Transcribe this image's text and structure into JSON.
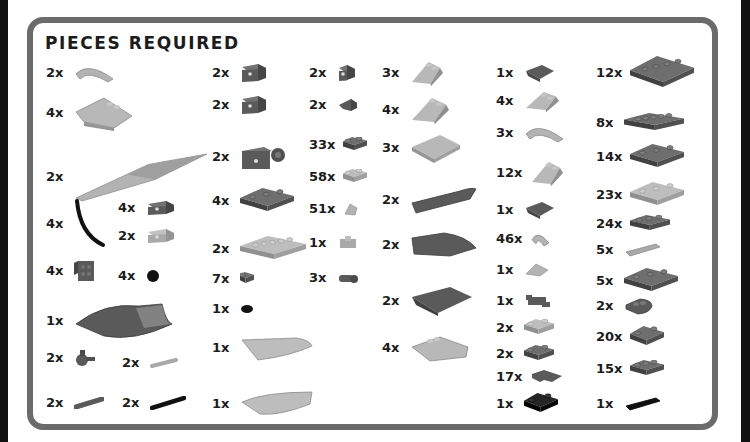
{
  "title": "PIECES REQUIRED",
  "colors": {
    "frame_border": "#6b6b6b",
    "background": "#ffffff",
    "dark_gray": "#5a5a5a",
    "light_gray": "#a9a9a9",
    "black": "#111111"
  },
  "pieces": [
    {
      "qty": "2x",
      "icon": "curved-slope-1x4",
      "color": "light_gray",
      "x": 46,
      "y": 73
    },
    {
      "qty": "4x",
      "icon": "wedge-slope-4x4",
      "color": "light_gray",
      "x": 46,
      "y": 113
    },
    {
      "qty": "2x",
      "icon": "wedge-wing-12",
      "color": "light_gray",
      "x": 46,
      "y": 177
    },
    {
      "qty": "4x",
      "icon": "flexible-tube-curved",
      "color": "black",
      "x": 46,
      "y": 224
    },
    {
      "qty": "4x",
      "icon": "bracket-1x2-inverted",
      "color": "dark_gray",
      "x": 118,
      "y": 208
    },
    {
      "qty": "2x",
      "icon": "bracket-1x2",
      "color": "light_gray",
      "x": 118,
      "y": 236
    },
    {
      "qty": "4x",
      "icon": "bracket-2x2-vertical",
      "color": "dark_gray",
      "x": 46,
      "y": 271
    },
    {
      "qty": "4x",
      "icon": "round-tile-1x1",
      "color": "black",
      "x": 118,
      "y": 276
    },
    {
      "qty": "1x",
      "icon": "wedge-plate-curved-large",
      "color": "dark_gray",
      "x": 46,
      "y": 321
    },
    {
      "qty": "2x",
      "icon": "technic-pin-connector",
      "color": "dark_gray",
      "x": 46,
      "y": 358
    },
    {
      "qty": "2x",
      "icon": "bar-1x3",
      "color": "light_gray",
      "x": 122,
      "y": 363
    },
    {
      "qty": "2x",
      "icon": "technic-pin-axle",
      "color": "dark_gray",
      "x": 46,
      "y": 403
    },
    {
      "qty": "2x",
      "icon": "technic-axle-long",
      "color": "black",
      "x": 122,
      "y": 403
    },
    {
      "qty": "2x",
      "icon": "technic-brick-1x2-hole",
      "color": "dark_gray",
      "x": 212,
      "y": 73
    },
    {
      "qty": "2x",
      "icon": "technic-brick-1x2-hole",
      "color": "dark_gray",
      "x": 212,
      "y": 105
    },
    {
      "qty": "2x",
      "icon": "brick-with-wheel-holder",
      "color": "dark_gray",
      "x": 212,
      "y": 157
    },
    {
      "qty": "4x",
      "icon": "plate-2x4",
      "color": "dark_gray",
      "x": 212,
      "y": 201
    },
    {
      "qty": "2x",
      "icon": "plate-2x6",
      "color": "light_gray",
      "x": 212,
      "y": 249
    },
    {
      "qty": "7x",
      "icon": "plate-1x1",
      "color": "dark_gray",
      "x": 212,
      "y": 279
    },
    {
      "qty": "1x",
      "icon": "round-plate-1x1",
      "color": "black",
      "x": 212,
      "y": 309
    },
    {
      "qty": "1x",
      "icon": "curved-wedge-light",
      "color": "light_gray",
      "x": 212,
      "y": 348
    },
    {
      "qty": "1x",
      "icon": "curved-wedge-light-mirror",
      "color": "light_gray",
      "x": 212,
      "y": 404
    },
    {
      "qty": "2x",
      "icon": "technic-brick-1x1-hole",
      "color": "dark_gray",
      "x": 309,
      "y": 73
    },
    {
      "qty": "2x",
      "icon": "slope-inverted-1x2",
      "color": "dark_gray",
      "x": 309,
      "y": 105
    },
    {
      "qty": "33x",
      "icon": "plate-1x2",
      "color": "dark_gray",
      "x": 309,
      "y": 145
    },
    {
      "qty": "58x",
      "icon": "plate-1x2",
      "color": "light_gray",
      "x": 309,
      "y": 177
    },
    {
      "qty": "51x",
      "icon": "slope-1x1",
      "color": "light_gray",
      "x": 309,
      "y": 209
    },
    {
      "qty": "1x",
      "icon": "plate-modified-clips",
      "color": "light_gray",
      "x": 309,
      "y": 243
    },
    {
      "qty": "3x",
      "icon": "plate-rounded-pin",
      "color": "dark_gray",
      "x": 309,
      "y": 278
    },
    {
      "qty": "3x",
      "icon": "slope-2x2-45",
      "color": "light_gray",
      "x": 382,
      "y": 73
    },
    {
      "qty": "4x",
      "icon": "wedge-slope-2x3",
      "color": "light_gray",
      "x": 382,
      "y": 110
    },
    {
      "qty": "3x",
      "icon": "slope-3x4",
      "color": "light_gray",
      "x": 382,
      "y": 148
    },
    {
      "qty": "2x",
      "icon": "curved-slope-2x6",
      "color": "dark_gray",
      "x": 382,
      "y": 200
    },
    {
      "qty": "2x",
      "icon": "curved-wedge-2x4",
      "color": "dark_gray",
      "x": 382,
      "y": 245
    },
    {
      "qty": "2x",
      "icon": "slope-inverted-double",
      "color": "dark_gray",
      "x": 382,
      "y": 301
    },
    {
      "qty": "4x",
      "icon": "wedge-slope-3x4-studs",
      "color": "light_gray",
      "x": 382,
      "y": 348
    },
    {
      "qty": "1x",
      "icon": "slope-inverted-2x2",
      "color": "dark_gray",
      "x": 496,
      "y": 73
    },
    {
      "qty": "4x",
      "icon": "wedge-slope-2x2-split",
      "color": "light_gray",
      "x": 496,
      "y": 101
    },
    {
      "qty": "3x",
      "icon": "curved-slope-1x4-arch",
      "color": "light_gray",
      "x": 496,
      "y": 133
    },
    {
      "qty": "12x",
      "icon": "slope-2x2",
      "color": "light_gray",
      "x": 496,
      "y": 173
    },
    {
      "qty": "1x",
      "icon": "slope-inverted-2x2",
      "color": "dark_gray",
      "x": 496,
      "y": 210
    },
    {
      "qty": "46x",
      "icon": "curved-slope-1x2",
      "color": "light_gray",
      "x": 496,
      "y": 239
    },
    {
      "qty": "1x",
      "icon": "slope-1x2-cheese",
      "color": "light_gray",
      "x": 496,
      "y": 270
    },
    {
      "qty": "1x",
      "icon": "plate-clip-horizontal",
      "color": "dark_gray",
      "x": 496,
      "y": 301
    },
    {
      "qty": "2x",
      "icon": "plate-1x2-handle",
      "color": "light_gray",
      "x": 496,
      "y": 328
    },
    {
      "qty": "2x",
      "icon": "plate-1x2-bar",
      "color": "dark_gray",
      "x": 496,
      "y": 354
    },
    {
      "qty": "17x",
      "icon": "plate-corner-2x2",
      "color": "dark_gray",
      "x": 496,
      "y": 377
    },
    {
      "qty": "1x",
      "icon": "plate-2x2",
      "color": "black",
      "x": 496,
      "y": 404
    },
    {
      "qty": "12x",
      "icon": "plate-4x4",
      "color": "dark_gray",
      "x": 596,
      "y": 73
    },
    {
      "qty": "8x",
      "icon": "plate-1x6",
      "color": "dark_gray",
      "x": 596,
      "y": 123
    },
    {
      "qty": "14x",
      "icon": "plate-2x4",
      "color": "dark_gray",
      "x": 596,
      "y": 157
    },
    {
      "qty": "23x",
      "icon": "plate-2x3",
      "color": "light_gray",
      "x": 596,
      "y": 195
    },
    {
      "qty": "24x",
      "icon": "plate-1x4",
      "color": "dark_gray",
      "x": 596,
      "y": 224
    },
    {
      "qty": "5x",
      "icon": "tile-1x4",
      "color": "light_gray",
      "x": 596,
      "y": 250
    },
    {
      "qty": "5x",
      "icon": "plate-2x3",
      "color": "dark_gray",
      "x": 596,
      "y": 281
    },
    {
      "qty": "2x",
      "icon": "plate-rounded-2x2",
      "color": "dark_gray",
      "x": 596,
      "y": 306
    },
    {
      "qty": "20x",
      "icon": "plate-2x2",
      "color": "dark_gray",
      "x": 596,
      "y": 337
    },
    {
      "qty": "15x",
      "icon": "plate-1x3",
      "color": "dark_gray",
      "x": 596,
      "y": 369
    },
    {
      "qty": "1x",
      "icon": "tile-1x3",
      "color": "black",
      "x": 596,
      "y": 404
    }
  ]
}
